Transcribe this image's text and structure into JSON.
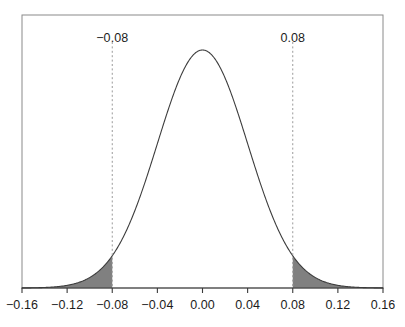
{
  "chart_data": {
    "type": "area",
    "title": "",
    "subtitle": "",
    "xlabel": "",
    "ylabel": "",
    "xlim": [
      -0.16,
      0.16
    ],
    "ylim": [
      0,
      1.05
    ],
    "grid": false,
    "legend": null,
    "distribution": {
      "family": "normal",
      "mean": 0.0,
      "sigma": 0.04
    },
    "x_ticks": [
      -0.16,
      -0.12,
      -0.08,
      -0.04,
      0.0,
      0.04,
      0.08,
      0.12,
      0.16
    ],
    "x_tick_labels": [
      "−0.16",
      "−0.12",
      "−0.08",
      "−0.04",
      "0.00",
      "0.04",
      "0.08",
      "0.12",
      "0.16"
    ],
    "y_ticks": [],
    "y_tick_labels": [],
    "annotations": [
      {
        "name": "lower-cutoff",
        "x": -0.08,
        "label": "−0.08",
        "line_style": "dashed"
      },
      {
        "name": "upper-cutoff",
        "x": 0.08,
        "label": "0.08",
        "line_style": "dashed"
      }
    ],
    "shaded_regions": [
      {
        "name": "left-tail",
        "from": -0.16,
        "to": -0.08,
        "fill": "#808080"
      },
      {
        "name": "right-tail",
        "from": 0.08,
        "to": 0.16,
        "fill": "#808080"
      }
    ],
    "series": [
      {
        "name": "normal-density",
        "x": [
          -0.16,
          -0.15,
          -0.14,
          -0.13,
          -0.12,
          -0.11,
          -0.1,
          -0.09,
          -0.08,
          -0.07,
          -0.06,
          -0.05,
          -0.04,
          -0.03,
          -0.02,
          -0.01,
          0.0,
          0.01,
          0.02,
          0.03,
          0.04,
          0.05,
          0.06,
          0.07,
          0.08,
          0.09,
          0.1,
          0.11,
          0.12,
          0.13,
          0.14,
          0.15,
          0.16
        ],
        "values": [
          0.0003,
          0.0009,
          0.0022,
          0.0053,
          0.0111,
          0.0219,
          0.0439,
          0.0796,
          0.1353,
          0.2163,
          0.3247,
          0.4578,
          0.6065,
          0.7548,
          0.8825,
          0.9692,
          1.0,
          0.9692,
          0.8825,
          0.7548,
          0.6065,
          0.4578,
          0.3247,
          0.2163,
          0.1353,
          0.0796,
          0.0439,
          0.0219,
          0.0111,
          0.0053,
          0.0022,
          0.0009,
          0.0003
        ]
      }
    ]
  },
  "colors": {
    "curve": "#3d3d3d",
    "frame": "#7a7a7a",
    "axis": "#3a3a3a",
    "shade": "#808080",
    "cutoff_line": "#9a9a9a",
    "text": "#1c1c1c",
    "background": "#ffffff"
  },
  "geometry": {
    "plot_left": 22,
    "plot_right": 383,
    "plot_top": 15,
    "plot_bottom": 288,
    "baseline": 288,
    "peak_y": 50
  }
}
